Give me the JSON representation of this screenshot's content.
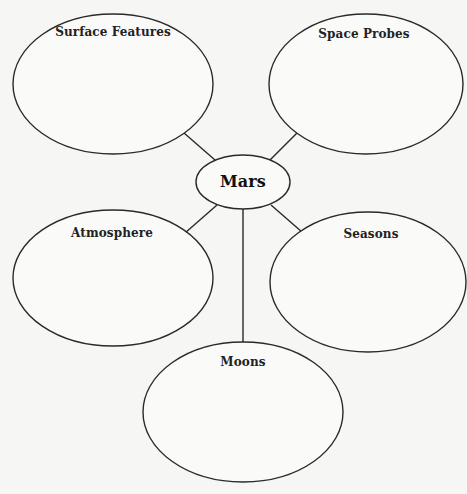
{
  "diagram": {
    "type": "concept-web",
    "center": {
      "id": "mars",
      "label": "Mars"
    },
    "nodes": [
      {
        "id": "surface-features",
        "label": "Surface Features"
      },
      {
        "id": "space-probes",
        "label": "Space Probes"
      },
      {
        "id": "atmosphere",
        "label": "Atmosphere"
      },
      {
        "id": "seasons",
        "label": "Seasons"
      },
      {
        "id": "moons",
        "label": "Moons"
      }
    ],
    "edges": [
      {
        "from": "mars",
        "to": "surface-features"
      },
      {
        "from": "mars",
        "to": "space-probes"
      },
      {
        "from": "mars",
        "to": "atmosphere"
      },
      {
        "from": "mars",
        "to": "seasons"
      },
      {
        "from": "mars",
        "to": "moons"
      }
    ],
    "colors": {
      "background": "#f6f6f4",
      "stroke": "#2a2a2a",
      "text": "#222222"
    }
  }
}
